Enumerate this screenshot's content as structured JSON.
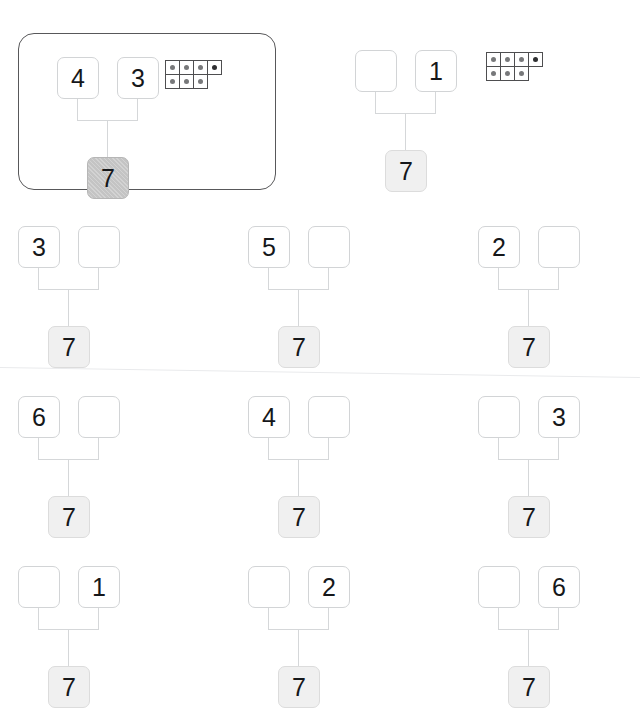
{
  "worksheet": {
    "title": "Number bonds to 7",
    "target_total": "7",
    "canvas": {
      "width": 598,
      "height": 713
    },
    "colors": {
      "box_border": "#d2d4d6",
      "total_fill": "#f0f0f0",
      "example_border": "#58585a",
      "connector": "#d5d7d9",
      "dot": "#77787a",
      "dot_dark": "#2e2f31",
      "tenframe_border": "#4e4e50",
      "text": "#15171a"
    }
  },
  "example_frame": {
    "label": "worked-example",
    "x": 18,
    "y": 33,
    "width": 256,
    "height": 155
  },
  "problems": [
    {
      "id": "example",
      "is_example": true,
      "x": 57,
      "y": 57,
      "part_left": "4",
      "part_right": "3",
      "total": "7",
      "total_hatched": true,
      "tenframe": {
        "x": 166,
        "y": 60,
        "top_row": [
          "dot",
          "dot",
          "dot",
          "dot"
        ],
        "bottom_row": [
          "dot",
          "dot",
          "dot",
          "blank"
        ]
      }
    },
    {
      "id": "p1",
      "is_example": false,
      "x": 355,
      "y": 50,
      "part_left": "",
      "part_right": "1",
      "total": "7",
      "total_hatched": false,
      "tenframe": {
        "x": 487,
        "y": 52,
        "top_row": [
          "dot",
          "dot",
          "dot",
          "dot"
        ],
        "bottom_row": [
          "dot",
          "dot",
          "dot",
          "blank"
        ]
      }
    },
    {
      "id": "p2",
      "is_example": false,
      "x": 18,
      "y": 226,
      "part_left": "3",
      "part_right": "",
      "total": "7",
      "total_hatched": false,
      "tenframe": null
    },
    {
      "id": "p3",
      "is_example": false,
      "x": 248,
      "y": 226,
      "part_left": "5",
      "part_right": "",
      "total": "7",
      "total_hatched": false,
      "tenframe": null
    },
    {
      "id": "p4",
      "is_example": false,
      "x": 478,
      "y": 226,
      "part_left": "2",
      "part_right": "",
      "total": "7",
      "total_hatched": false,
      "tenframe": null
    },
    {
      "id": "p5",
      "is_example": false,
      "x": 18,
      "y": 396,
      "part_left": "6",
      "part_right": "",
      "total": "7",
      "total_hatched": false,
      "tenframe": null
    },
    {
      "id": "p6",
      "is_example": false,
      "x": 248,
      "y": 396,
      "part_left": "4",
      "part_right": "",
      "total": "7",
      "total_hatched": false,
      "tenframe": null
    },
    {
      "id": "p7",
      "is_example": false,
      "x": 478,
      "y": 396,
      "part_left": "",
      "part_right": "3",
      "total": "7",
      "total_hatched": false,
      "tenframe": null
    },
    {
      "id": "p8",
      "is_example": false,
      "x": 18,
      "y": 566,
      "part_left": "",
      "part_right": "1",
      "total": "7",
      "total_hatched": false,
      "tenframe": null
    },
    {
      "id": "p9",
      "is_example": false,
      "x": 248,
      "y": 566,
      "part_left": "",
      "part_right": "2",
      "total": "7",
      "total_hatched": false,
      "tenframe": null
    },
    {
      "id": "p10",
      "is_example": false,
      "x": 478,
      "y": 566,
      "part_left": "",
      "part_right": "6",
      "total": "7",
      "total_hatched": false,
      "tenframe": null
    }
  ]
}
